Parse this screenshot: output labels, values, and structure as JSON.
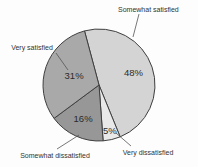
{
  "chart_data": {
    "type": "pie",
    "title": "",
    "legend": "none",
    "direction": "clockwise",
    "start_angle_deg": -15,
    "outline_color": "#3f3f3f",
    "leader_line_color": "#555555",
    "text_color": "#333333",
    "pct_text_color": "#2b2b2b",
    "background_color": "#fdfdfd",
    "slices": [
      {
        "label": "Somewhat satisfied",
        "value": 48,
        "pct_label": "48%",
        "color": "#d4d4d4"
      },
      {
        "label": "Very dissatisfied",
        "value": 5,
        "pct_label": "5%",
        "color": "#e9e9e9"
      },
      {
        "label": "Somewhat dissatisfied",
        "value": 16,
        "pct_label": "16%",
        "color": "#979797"
      },
      {
        "label": "Very satisfied",
        "value": 31,
        "pct_label": "31%",
        "color": "#a9a9a9"
      }
    ],
    "layout": {
      "center": {
        "x": 99,
        "y": 85
      },
      "radius": 56,
      "pct_label_radius_frac": [
        0.65,
        0.85,
        0.68,
        0.47
      ],
      "callouts": [
        {
          "text_x": 118,
          "text_y": 12,
          "anchor": "start",
          "line": [
            139,
            14,
            133,
            37
          ]
        },
        {
          "text_x": 148,
          "text_y": 155,
          "anchor": "middle",
          "line": [
            131,
            146,
            116,
            133
          ]
        },
        {
          "text_x": 55,
          "text_y": 158,
          "anchor": "middle",
          "line": [
            57,
            149,
            79,
            135
          ]
        },
        {
          "text_x": 32,
          "text_y": 50,
          "anchor": "middle",
          "line": [
            56,
            53,
            68,
            70
          ]
        }
      ]
    }
  }
}
